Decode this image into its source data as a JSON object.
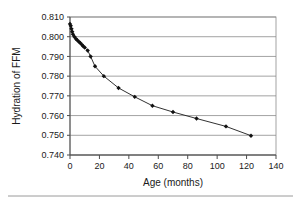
{
  "chart_data": {
    "type": "line",
    "title": "",
    "subtitle": "",
    "xlabel": "Age (months)",
    "ylabel": "Hydration of FFM",
    "xlim": [
      0,
      140
    ],
    "ylim": [
      0.74,
      0.81
    ],
    "xticks": [
      0,
      20,
      40,
      60,
      80,
      100,
      120,
      140
    ],
    "xtick_labels": [
      "0",
      "20",
      "40",
      "60",
      "80",
      "100",
      "120",
      "140"
    ],
    "yticks": [
      0.74,
      0.75,
      0.76,
      0.77,
      0.78,
      0.79,
      0.8,
      0.81
    ],
    "ytick_labels": [
      "0.740",
      "0.750",
      "0.760",
      "0.770",
      "0.780",
      "0.790",
      "0.800",
      "0.810"
    ],
    "grid": "horizontal",
    "legend": "none",
    "marker": "filled-diamond",
    "marker_color": "#111111",
    "line_color": "#1a1a1a",
    "grid_color": "#8c8c8c",
    "series": [
      {
        "name": "Hydration of FFM vs Age",
        "x": [
          0,
          0.5,
          1,
          1.5,
          2,
          3,
          4,
          5,
          6,
          7,
          8,
          9,
          10,
          12,
          14,
          17,
          23,
          33,
          44,
          56,
          70,
          86,
          106,
          123
        ],
        "y": [
          0.8065,
          0.8055,
          0.804,
          0.8025,
          0.8012,
          0.8,
          0.799,
          0.7982,
          0.7975,
          0.7968,
          0.796,
          0.7952,
          0.7945,
          0.793,
          0.79,
          0.785,
          0.78,
          0.774,
          0.7695,
          0.765,
          0.7618,
          0.7585,
          0.7545,
          0.7498
        ]
      }
    ]
  },
  "figure": {
    "background": "#ffffff",
    "axis_color": "#4d4d4d"
  }
}
